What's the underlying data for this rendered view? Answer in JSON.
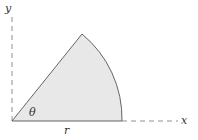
{
  "diagram": {
    "type": "circular sector",
    "labels": {
      "y_axis": "y",
      "x_axis": "x",
      "angle": "θ",
      "radius": "r"
    },
    "colors": {
      "fill": "#e8e8e8",
      "stroke": "#555555",
      "axis": "#777777"
    },
    "geometry": {
      "origin": [
        12,
        121
      ],
      "radius_px": 110,
      "angle_deg": 51
    }
  }
}
